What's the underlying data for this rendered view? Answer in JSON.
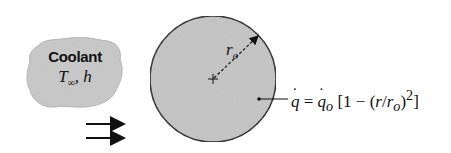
{
  "diagram": {
    "coolant": {
      "title": "Coolant",
      "temp_symbol": "T",
      "temp_subscript": "∞",
      "separator": ",",
      "h_symbol": "h"
    },
    "cylinder": {
      "radius_label": "r",
      "radius_subscript": "o",
      "fill_color": "#c4c4c4",
      "stroke_color": "#222222"
    },
    "equation": {
      "lhs": "q",
      "equals": "=",
      "q0": "q",
      "q0_sub": "o",
      "bracket_open": "[1 − (",
      "r": "r",
      "slash": "/",
      "r0": "r",
      "r0_sub": "o",
      "close": ")",
      "exponent": "2",
      "bracket_close": "]"
    },
    "flow_arrows": {
      "count": 2,
      "direction": "right"
    }
  }
}
